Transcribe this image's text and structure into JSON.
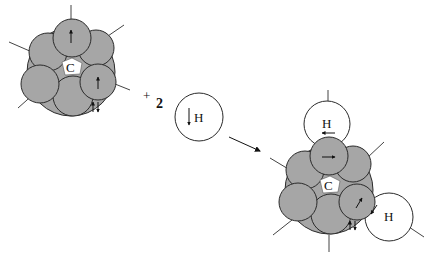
{
  "diagram": {
    "colors": {
      "lobe_fill": "#a6a6a6",
      "stroke": "#2a2a2a",
      "background": "#ffffff",
      "h_fill": "#ffffff"
    },
    "reactant_carbon": {
      "label": "C"
    },
    "operator": {
      "plus": "+",
      "coefficient": "2"
    },
    "hydrogen_reactant": {
      "label": "H",
      "spin": "down"
    },
    "product": {
      "carbon_label": "C",
      "h_top_label": "H",
      "h_right_label": "H"
    }
  }
}
